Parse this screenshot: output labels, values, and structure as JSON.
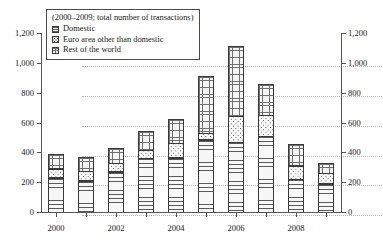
{
  "chart_data": {
    "type": "bar",
    "stacked": true,
    "title": "(2000–2009; total number of transactions)",
    "xlabel": "",
    "ylabel": "",
    "ylim": [
      0,
      1200
    ],
    "yticks": [
      0,
      200,
      400,
      600,
      800,
      1000,
      1200
    ],
    "ytick_labels": [
      "0",
      "200",
      "400",
      "600",
      "800",
      "1,000",
      "1,200"
    ],
    "right_axis_labels": [
      "0",
      "200",
      "400",
      "600",
      "800",
      "1,000",
      "1,200"
    ],
    "grid": true,
    "legend_position": "top-left",
    "categories": [
      2000,
      2001,
      2002,
      2003,
      2004,
      2005,
      2006,
      2007,
      2008,
      2009
    ],
    "xtick_labels": [
      "2000",
      "",
      "2002",
      "",
      "2004",
      "",
      "2006",
      "",
      "2008",
      ""
    ],
    "series": [
      {
        "name": "Domestic",
        "pattern": "horizontal-lines",
        "values": [
          235,
          215,
          275,
          365,
          370,
          490,
          475,
          515,
          225,
          195
        ]
      },
      {
        "name": "Euro area other than domestic",
        "pattern": "dotted",
        "values": [
          65,
          70,
          60,
          60,
          100,
          50,
          175,
          145,
          95,
          75
        ]
      },
      {
        "name": "Rest of the world",
        "pattern": "cross-grid",
        "values": [
          100,
          100,
          105,
          135,
          170,
          385,
          480,
          210,
          150,
          70
        ]
      }
    ],
    "totals": [
      400,
      385,
      440,
      560,
      640,
      925,
      1130,
      870,
      470,
      340
    ]
  },
  "legend": {
    "title": "(2000–2009; total number of transactions)",
    "items": [
      {
        "label": "Domestic"
      },
      {
        "label": "Euro area other than domestic"
      },
      {
        "label": "Rest of the world"
      }
    ]
  }
}
